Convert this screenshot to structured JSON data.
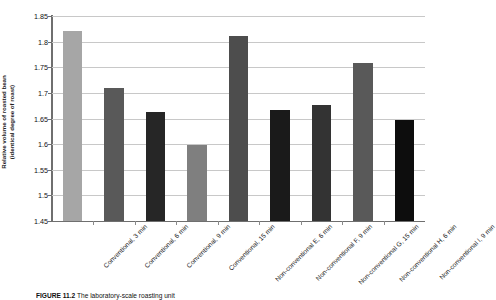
{
  "figure": {
    "caption_prefix": "FIGURE 11.2",
    "caption_text": "The laboratory-scale roasting unit"
  },
  "chart_data": {
    "type": "bar",
    "title": "",
    "xlabel": "",
    "ylabel": "Relative volume of roasted bean (identical degree of roast)",
    "ylabel_line1": "Relative volume of roasted bean",
    "ylabel_line2": "(identical degree of roast)",
    "ylim": [
      1.45,
      1.85
    ],
    "ystep": 0.05,
    "grid": true,
    "legend": "none",
    "ytick_labels": [
      "1.85",
      "1.8",
      "1.75",
      "1.7",
      "1.65",
      "1.6",
      "1.55",
      "1.5",
      "1.45"
    ],
    "ytick_values": [
      1.85,
      1.8,
      1.75,
      1.7,
      1.65,
      1.6,
      1.55,
      1.5,
      1.45
    ],
    "categories": [
      "Conventional, 3 min",
      "Conventional, 6 min",
      "Conventional, 9 min",
      "Conventional, 15 min",
      "Non-conventional E, 6 min",
      "Non-conventional F, 9 min",
      "Non-conventional G, 15 min",
      "Non-conventional H, 6 min",
      "Non-conventional I, 9 min"
    ],
    "values": [
      1.82,
      1.71,
      1.663,
      1.599,
      1.811,
      1.667,
      1.677,
      1.758,
      1.648
    ],
    "bar_colors": [
      "#a6a6a6",
      "#595959",
      "#262626",
      "#7f7f7f",
      "#4d4d4d",
      "#1a1a1a",
      "#333333",
      "#595959",
      "#0d0d0d"
    ]
  },
  "colors": {
    "axis": "#6f6f6f",
    "gridline": "#c8c8c8",
    "text": "#111111",
    "background": "#ffffff"
  }
}
